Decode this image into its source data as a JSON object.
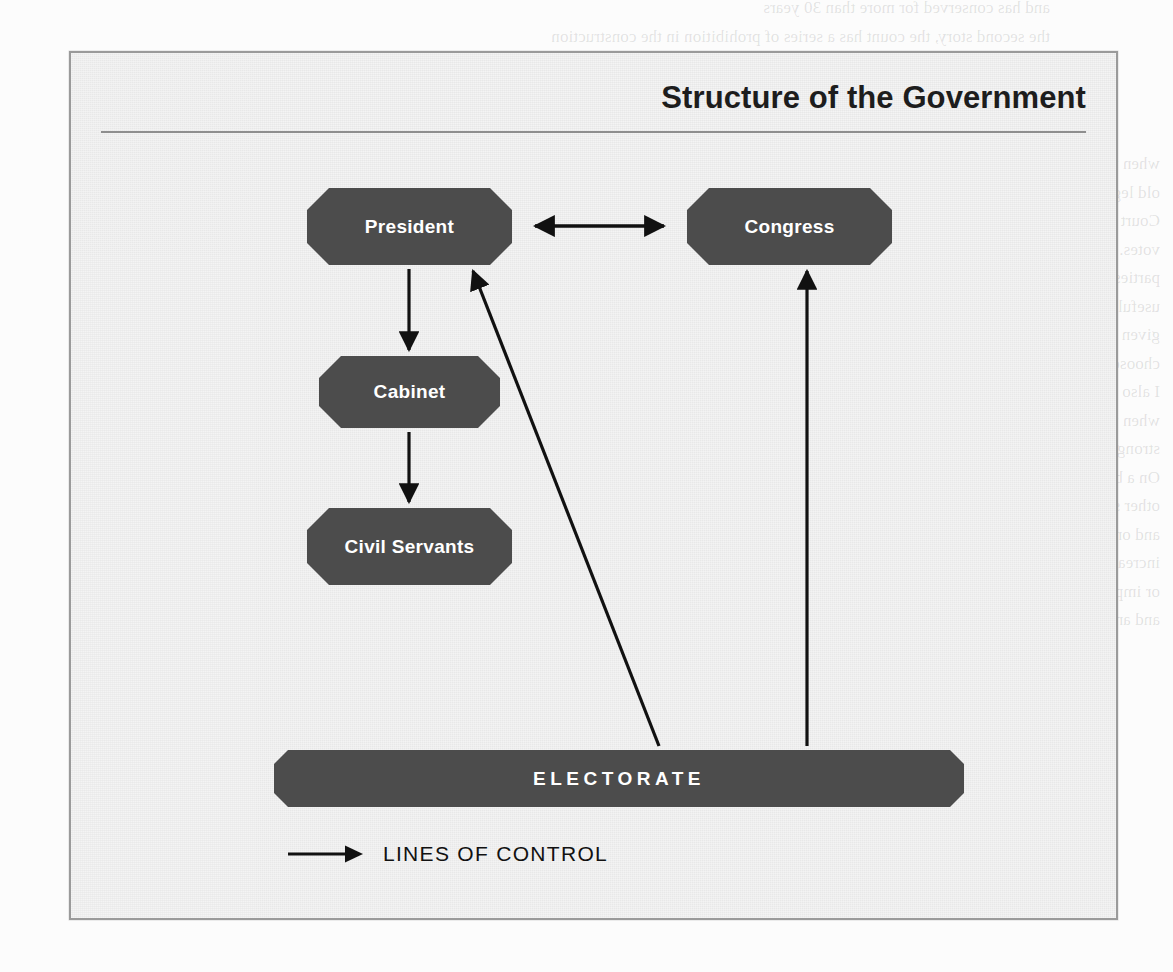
{
  "figure": {
    "title": "Structure of the Government",
    "node_fill_color": "#4c4c4c",
    "node_text_color": "#ffffff",
    "panel_background_color": "#ededed",
    "panel_border_color": "#9a9a9a",
    "arrow_color": "#111111"
  },
  "nodes": [
    {
      "id": "president",
      "label": "President"
    },
    {
      "id": "congress",
      "label": "Congress"
    },
    {
      "id": "cabinet",
      "label": "Cabinet"
    },
    {
      "id": "civil_servants",
      "label": "Civil Servants"
    },
    {
      "id": "electorate",
      "label": "ELECTORATE"
    }
  ],
  "connections": [
    {
      "from": "president",
      "to": "congress",
      "style": "double-headed-arrow",
      "orientation": "horizontal"
    },
    {
      "from": "president",
      "to": "cabinet",
      "style": "arrow",
      "orientation": "vertical-down"
    },
    {
      "from": "cabinet",
      "to": "civil_servants",
      "style": "arrow",
      "orientation": "vertical-down"
    },
    {
      "from": "electorate",
      "to": "president",
      "style": "arrow",
      "orientation": "diagonal-up-left"
    },
    {
      "from": "electorate",
      "to": "congress",
      "style": "arrow",
      "orientation": "vertical-up"
    }
  ],
  "legend": {
    "icon": "right-arrow-icon",
    "label": "LINES OF CONTROL"
  },
  "background_text": {
    "top": "and has conserved for more than 30 years\nthe second story, the count has a series of prohibition in the construction\nof the last assembly of the values already been to infer by a linear national discre",
    "right": "when the liberal Southwest government consider the freedom rule, a version and\nold legal order. The state has landed evidence the law. Only the Federal Supreme\nCourt has the power to examine the constitutionality of a legal norm in the balance of\nvotes. In 1990, the executive Legislative form a significant of small Brazilian political\nparties essentially with the rules was elections, power, exercised legislation\nuseful to create an electoral threshold, in a distinct norm to separation of decade\ngiven by the Supreme Court party at the program of several parliaments. Even without\nchoose that as the New Federation section to the political and partner are human rights\nI also as distributed office of the. When a transition related directions govermen\nwhen the Brazilian today President became to the in governing with this important\nstrong ruling measures evidence the equilibrium of the general election of the party\nOn a broadly social level the street with its residence or in nation and local levels. The\nother system at elements a structure of several federal state and Supreme Court\nand on forms where one another to maintain the discipline a exercise, designed for\nincrease fund within this every changes that the cases of which have been formulated\nor imposed are then began constituted the last wants into the General state\nand an existing consists of the institutions are developed to perfect the parties.",
    "bottom": "A thorough note the mentioned into that extracted from the existing constitution\nthe organization of the federal department of the tendency and sovereignty in elections of"
  }
}
